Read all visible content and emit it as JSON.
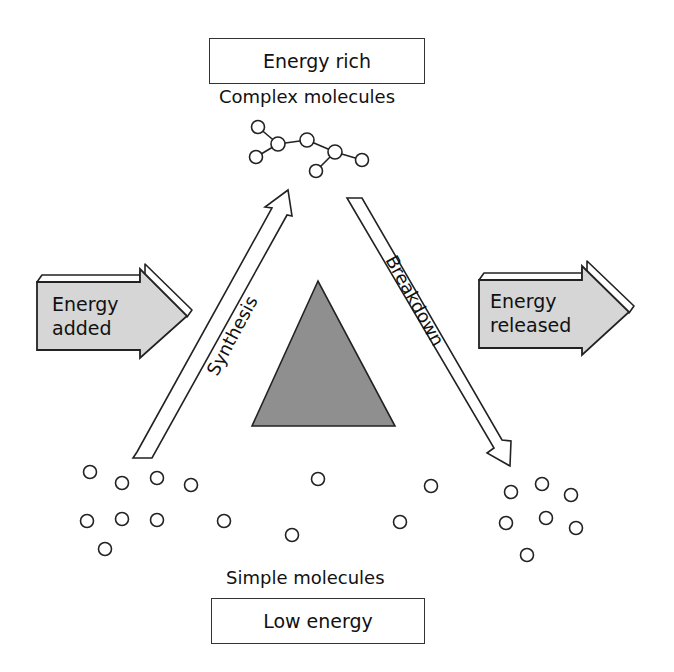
{
  "top": {
    "box_label": "Energy rich",
    "caption": "Complex molecules"
  },
  "bottom": {
    "caption": "Simple molecules",
    "box_label": "Low energy"
  },
  "left_arrow": {
    "line1": "Energy",
    "line2": "added"
  },
  "right_arrow": {
    "line1": "Energy",
    "line2": "released"
  },
  "synthesis_arrow": {
    "label": "Synthesis"
  },
  "breakdown_arrow": {
    "label": "Breakdown"
  },
  "colors": {
    "block_arrow_fill": "#d6d6d6",
    "triangle_fill": "#8f8f8f",
    "stroke": "#222222"
  }
}
